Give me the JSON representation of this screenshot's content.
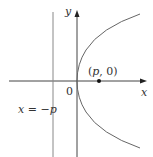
{
  "diagram": {
    "labels": {
      "y_axis": "y",
      "x_axis": "x",
      "origin": "0",
      "focus_open": "(",
      "focus_p": "p",
      "focus_rest": ", 0)",
      "directrix_x": "x",
      "directrix_eq": " = −",
      "directrix_p": "p"
    },
    "colors": {
      "axis": "#333333",
      "curve": "#555555",
      "directrix": "#777777"
    }
  }
}
